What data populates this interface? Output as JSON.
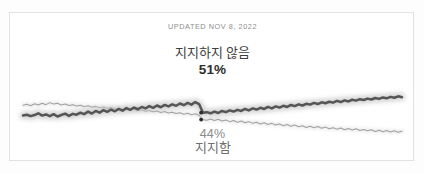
{
  "card": {
    "updated_label": "UPDATED NOV 8, 2022",
    "background_color": "#ffffff",
    "border_color": "#e2e2e2"
  },
  "chart_data": {
    "type": "line",
    "title": "",
    "subtitle": "UPDATED NOV 8, 2022",
    "xlabel": "",
    "ylabel": "",
    "ylim": [
      35,
      60
    ],
    "grid": false,
    "legend_position": "inline-annotation",
    "annotations": [
      {
        "name": "oppose-label",
        "text": "지지하지 않음",
        "value": "51%",
        "color": "#3d3d3d",
        "emphasis": "bold"
      },
      {
        "name": "support-label",
        "text": "지지함",
        "value": "44%",
        "color": "#8b8b8b",
        "emphasis": "normal"
      }
    ],
    "crossover_markers": [
      {
        "series": "지지하지 않음",
        "x": 47.0,
        "y": 47.6
      },
      {
        "series": "지지함",
        "x": 47.0,
        "y": 45.2
      }
    ],
    "series": [
      {
        "name": "지지하지 않음",
        "label_en": "Disapprove",
        "end_value": 51,
        "color": "#555555",
        "glow_color": "#c9c9c9",
        "width": 2.6,
        "values": [
          46.6,
          46.9,
          46.4,
          46.8,
          47.4,
          46.6,
          47.0,
          46.4,
          47.1,
          46.3,
          46.8,
          47.3,
          46.5,
          47.2,
          46.9,
          47.6,
          47.1,
          48.0,
          47.3,
          48.2,
          47.6,
          48.5,
          47.9,
          48.7,
          48.1,
          48.9,
          48.3,
          49.2,
          48.6,
          49.4,
          48.8,
          49.6,
          49.1,
          49.9,
          49.3,
          50.1,
          49.5,
          50.3,
          49.8,
          50.5,
          50.0,
          50.8,
          50.2,
          51.0,
          50.4,
          51.3,
          50.6,
          47.6,
          47.8,
          47.4,
          48.0,
          47.5,
          48.2,
          47.8,
          48.4,
          48.0,
          48.6,
          48.2,
          48.9,
          48.4,
          49.1,
          48.7,
          49.3,
          48.9,
          49.6,
          49.1,
          49.8,
          49.4,
          50.0,
          49.6,
          50.3,
          49.9,
          50.5,
          50.1,
          50.7,
          50.4,
          51.0,
          50.6,
          51.2,
          50.9,
          51.4,
          51.1,
          51.7,
          51.3,
          51.9,
          51.5,
          52.1,
          51.8,
          52.3,
          52.0,
          52.5,
          52.2,
          52.7,
          52.4,
          52.9,
          52.6,
          53.1,
          52.8,
          53.3,
          53.0
        ]
      },
      {
        "name": "지지함",
        "label_en": "Approve",
        "end_value": 44,
        "color": "#a8a8a8",
        "glow_color": "#e8e8e8",
        "width": 1.0,
        "values": [
          50.2,
          50.5,
          50.0,
          50.7,
          50.3,
          50.9,
          50.4,
          51.1,
          50.6,
          50.9,
          50.3,
          50.6,
          50.1,
          50.4,
          49.9,
          50.2,
          49.7,
          50.0,
          49.5,
          49.8,
          49.3,
          49.6,
          49.1,
          49.4,
          48.9,
          49.2,
          48.7,
          49.0,
          48.5,
          48.8,
          48.3,
          48.6,
          48.1,
          48.4,
          47.9,
          48.2,
          47.7,
          48.0,
          47.5,
          47.8,
          47.3,
          47.6,
          47.1,
          47.4,
          46.9,
          47.2,
          46.7,
          45.2,
          45.0,
          45.4,
          44.9,
          45.3,
          44.7,
          45.1,
          44.5,
          44.9,
          44.3,
          44.7,
          44.1,
          44.5,
          43.9,
          44.3,
          43.7,
          44.1,
          43.5,
          43.9,
          43.3,
          43.7,
          43.1,
          43.5,
          42.9,
          43.3,
          42.7,
          43.1,
          42.5,
          42.9,
          42.4,
          42.8,
          42.2,
          42.6,
          42.0,
          42.4,
          41.9,
          42.3,
          41.7,
          42.1,
          41.6,
          42.0,
          41.4,
          41.8,
          41.3,
          41.7,
          41.1,
          41.5,
          41.0,
          41.4,
          40.9,
          41.3,
          40.8,
          41.2
        ]
      }
    ]
  }
}
